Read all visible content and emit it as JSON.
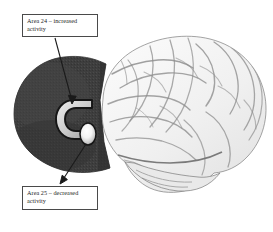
{
  "figure": {
    "type": "annotated-brain-diagram",
    "background_color": "#ffffff",
    "width": 273,
    "height": 232
  },
  "callouts": [
    {
      "id": "area-24",
      "line1": "Area 24 – increased",
      "line2": "activity",
      "full_text": "Area 24 – increased activity",
      "region_name": "Area 24",
      "finding": "increased activity",
      "points_to": "cingulate-c-structure"
    },
    {
      "id": "area-25",
      "line1": "Area 25 –  decreased",
      "line2": "activity",
      "full_text": "Area 25 – decreased activity",
      "region_name": "Area 25",
      "finding": "decreased activity",
      "points_to": "subgenual-blob"
    }
  ],
  "anatomy": {
    "medial_section_label": "medial-cut-ellipse",
    "cortex_label": "lateral-cortical-surface",
    "cingulate_label": "cingulate-c-structure",
    "blob_label": "subgenual-blob"
  },
  "colors": {
    "page_background": "#ffffff",
    "medial_section_dark": "#3e3e3e",
    "medial_section_dark_edge": "#2a2a2a",
    "cortex_light": "#f2f2f2",
    "cortex_sulci": "#8a8a8a",
    "cortex_outline": "#6f6f6f",
    "cingulate_outline": "#1c1c1c",
    "cingulate_fill": "#d2d2d2",
    "blob_highlight": "#ffffff",
    "blob_outline": "#1a1a1a",
    "callout_border": "#4a4a4a",
    "callout_text": "#242424",
    "leader_line": "#1a1a1a"
  }
}
